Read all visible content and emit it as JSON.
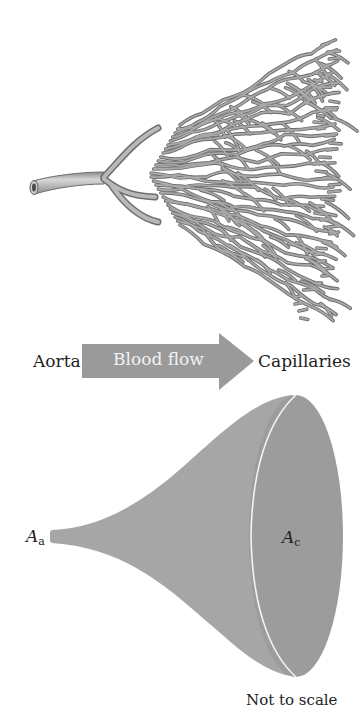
{
  "figure": {
    "top_illustration": {
      "description": "Branching network of blood vessels from a single aorta into many capillaries",
      "vessel_color": "#9b9b9b",
      "vessel_outline": "#6e6e6e"
    },
    "arrow": {
      "label": "Blood flow",
      "color": "#9a9a9a",
      "text_color": "#f2f2f2"
    },
    "labels": {
      "left": "Aorta",
      "right": "Capillaries"
    },
    "cone": {
      "small_end_label": "A",
      "small_end_subscript": "a",
      "large_end_label": "A",
      "large_end_subscript": "c",
      "body_color": "#a6a6a6",
      "face_color": "#9c9c9c",
      "rim_color": "#f4f4f4"
    },
    "note": "Not to scale"
  }
}
